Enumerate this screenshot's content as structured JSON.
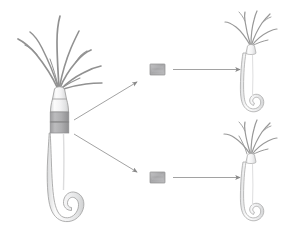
{
  "figure": {
    "background_color": "#ffffff",
    "width": 285,
    "height": 231
  },
  "palette": {
    "outline": "#9a9a9a",
    "outline_dark": "#7d7d7d",
    "tentacle": "#8f8f8f",
    "body_fill_light": "#fbfbfb",
    "body_fill_mid": "#ececed",
    "body_shadow": "#d8d9da",
    "band_gray": "#a9a9aa",
    "band_gray_dark": "#939395",
    "graft_fill": "#b0b0b2",
    "graft_edge": "#8c8c8e",
    "arrow": "#8a8a8a"
  },
  "elements": {
    "parent_hydra": {
      "name": "Hydra (intact polyp)",
      "parts": {
        "tentacles": "tentacle crown",
        "hypostome": "mouth cone",
        "body_column": "gastric region",
        "marked_band": "excision band",
        "peduncle": "stalk",
        "basal_disc": "foot"
      }
    },
    "graft_top": {
      "name": "excised tissue piece (upper)",
      "shape": "rectangle"
    },
    "graft_bottom": {
      "name": "excised tissue piece (lower)",
      "shape": "rectangle"
    },
    "regenerate_top": {
      "name": "regenerated hydra (upper)"
    },
    "regenerate_bottom": {
      "name": "regenerated hydra (lower)"
    },
    "arrows": {
      "diagonal_up": "parent band to upper tissue piece",
      "diagonal_down": "parent band to lower tissue piece",
      "horizontal_top": "upper tissue piece to upper regenerate",
      "horizontal_bottom": "lower tissue piece to lower regenerate"
    }
  },
  "labels": {
    "items": []
  }
}
